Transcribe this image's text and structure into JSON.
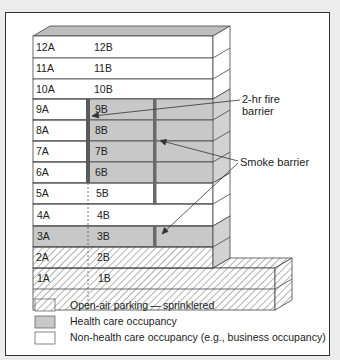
{
  "diagram": {
    "type": "building-section",
    "floors": [
      {
        "level": 12,
        "a": "12A",
        "b": "12B",
        "occupancy": "non-health"
      },
      {
        "level": 11,
        "a": "11A",
        "b": "11B",
        "occupancy": "non-health"
      },
      {
        "level": 10,
        "a": "10A",
        "b": "10B",
        "occupancy": "non-health"
      },
      {
        "level": 9,
        "a": "9A",
        "b": "9B",
        "occupancy": "health-b-side"
      },
      {
        "level": 8,
        "a": "8A",
        "b": "8B",
        "occupancy": "health-b-side"
      },
      {
        "level": 7,
        "a": "7A",
        "b": "7B",
        "occupancy": "health-b-side"
      },
      {
        "level": 6,
        "a": "6A",
        "b": "6B",
        "occupancy": "health-b-side"
      },
      {
        "level": 5,
        "a": "5A",
        "b": "5B",
        "occupancy": "non-health"
      },
      {
        "level": 4,
        "a": "4A",
        "b": "4B",
        "occupancy": "non-health"
      },
      {
        "level": 3,
        "a": "3A",
        "b": "3B",
        "occupancy": "health"
      },
      {
        "level": 2,
        "a": "2A",
        "b": "2B",
        "occupancy": "parking"
      },
      {
        "level": 1,
        "a": "1A",
        "b": "1B",
        "occupancy": "parking"
      }
    ],
    "annotations": {
      "fire_barrier_line1": "2-hr fire",
      "fire_barrier_line2": "barrier",
      "smoke_barrier": "Smoke barrier"
    },
    "legend": [
      {
        "pattern": "hatched",
        "label": "Open-air parking — sprinklered"
      },
      {
        "pattern": "gray",
        "label": "Health care occupancy"
      },
      {
        "pattern": "white",
        "label": "Non-health care occupancy (e.g., business occupancy)"
      }
    ],
    "colors": {
      "health": "#c8c8c8",
      "side_face": "#d8d8d8",
      "barrier": "#5a5a5a",
      "line": "#444444"
    }
  }
}
